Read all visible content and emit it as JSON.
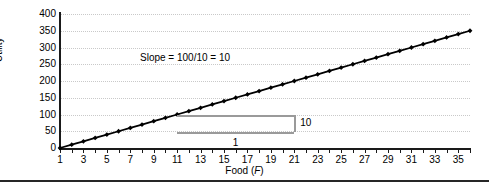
{
  "chart_data": {
    "type": "line",
    "title": "",
    "xlabel": "Food (F)",
    "ylabel": "Utility",
    "xlim": [
      1,
      36
    ],
    "ylim": [
      0,
      400
    ],
    "grid": true,
    "legend": null,
    "x_ticks": [
      1,
      3,
      5,
      7,
      9,
      11,
      13,
      15,
      17,
      19,
      21,
      23,
      25,
      27,
      29,
      31,
      33,
      35
    ],
    "y_ticks": [
      0,
      50,
      100,
      150,
      200,
      250,
      300,
      350,
      400
    ],
    "series": [
      {
        "name": "Utility",
        "marker": "diamond",
        "color": "#000000",
        "x": [
          1,
          2,
          3,
          4,
          5,
          6,
          7,
          8,
          9,
          10,
          11,
          12,
          13,
          14,
          15,
          16,
          17,
          18,
          19,
          20,
          21,
          22,
          23,
          24,
          25,
          26,
          27,
          28,
          29,
          30,
          31,
          32,
          33,
          34,
          35,
          36
        ],
        "values": [
          0,
          10,
          20,
          30,
          40,
          50,
          60,
          70,
          80,
          90,
          100,
          110,
          120,
          130,
          140,
          150,
          160,
          170,
          180,
          190,
          200,
          210,
          220,
          230,
          240,
          250,
          260,
          270,
          280,
          290,
          300,
          310,
          320,
          330,
          340,
          350
        ]
      }
    ],
    "annotations": [
      {
        "id": "slope-text",
        "text": "Slope = 100/10 = 10",
        "x": 11.5,
        "y": 243
      },
      {
        "id": "rise-label",
        "text": "10",
        "x": 21.8,
        "y": 75
      },
      {
        "id": "run-label",
        "text": "1",
        "x": 16,
        "y": 35
      }
    ],
    "slope_triangle": {
      "x_start": 11,
      "x_end": 21,
      "y_top": 100,
      "y_bottom": 48,
      "color": "#9a9a9a"
    }
  },
  "axes": {
    "y_title": "Utility",
    "x_title_prefix": "Food (",
    "x_title_var": "F",
    "x_title_suffix": ")"
  }
}
